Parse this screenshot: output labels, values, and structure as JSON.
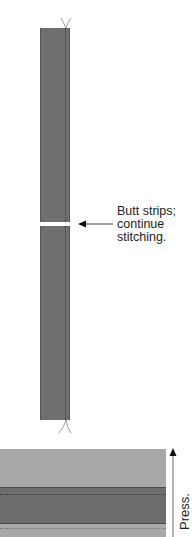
{
  "diagram": {
    "annotation": {
      "lines": [
        "Butt strips;",
        "continue",
        "stitching."
      ]
    },
    "press_label": "Press.",
    "colors": {
      "strip": "#6f6f6f",
      "strip_edge": "#555555",
      "panel_light": "#a9a9a9",
      "panel_dark": "#6e6e6e",
      "thread": "#888888"
    }
  }
}
